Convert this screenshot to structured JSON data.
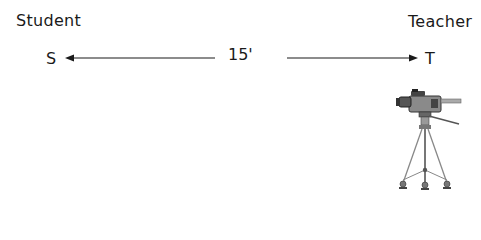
{
  "diagram": {
    "left_label": "Student",
    "right_label": "Teacher",
    "left_marker": "S",
    "right_marker": "T",
    "distance": "15'",
    "arrows": [
      {
        "direction": "left",
        "from_x": 215,
        "to_x": 67,
        "y": 58
      },
      {
        "direction": "right",
        "from_x": 287,
        "to_x": 417,
        "y": 58
      }
    ],
    "icon": "video-camera-on-tripod-icon",
    "line_color": "#1a1a1a"
  }
}
